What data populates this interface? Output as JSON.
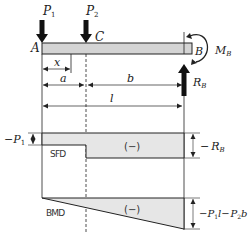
{
  "diagram": {
    "type": "cantilever beam with shear force and bending moment diagrams",
    "colors": {
      "line": "#222222",
      "fill": "#d4d4d4",
      "diagram_fill": "#e6e6e6"
    },
    "beam": {
      "left_label": "A",
      "right_label": "B",
      "point_label": "C"
    },
    "loads": {
      "p1_main": "P",
      "p1_sub": "1",
      "p2_main": "P",
      "p2_sub": "2"
    },
    "support": {
      "moment_main": "M",
      "moment_sub": "B",
      "reaction_main": "R",
      "reaction_sub": "B"
    },
    "dimensions": {
      "x": "x",
      "a": "a",
      "b": "b",
      "l": "l"
    },
    "sfd": {
      "label": "SFD",
      "sign": "(−)",
      "left_value_prefix": "−",
      "left_value_main": "P",
      "left_value_sub": "1",
      "right_value_prefix": "−",
      "right_value_main": "R",
      "right_value_sub": "B"
    },
    "bmd": {
      "label": "BMD",
      "sign": "(−)",
      "right_value_prefix": "−",
      "right_p1": "P",
      "right_p1_sub": "1",
      "right_l": "l",
      "right_minus": "−",
      "right_p2": "P",
      "right_p2_sub": "2",
      "right_b": "b"
    }
  }
}
